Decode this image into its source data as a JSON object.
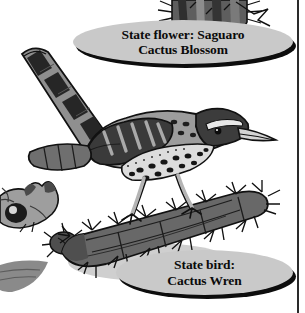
{
  "page": {
    "width": 305,
    "height": 313,
    "background": "#ffffff",
    "border_color": "#2a2a2a"
  },
  "callouts": [
    {
      "id": "state-flower",
      "line1": "State flower: Saguaro",
      "line2": "Cactus Blossom",
      "fill": "#c9c9c9",
      "text_color": "#0b0b0b",
      "shadow": "#0d0d0d"
    },
    {
      "id": "state-bird",
      "line1": "State bird:",
      "line2": "Cactus Wren",
      "fill": "#c9c9c9",
      "text_color": "#0b0b0b",
      "shadow": "#0d0d0d"
    }
  ],
  "artwork": {
    "style": "grayscale clip-art line illustration",
    "subjects": [
      "cactus-wren-bird",
      "thorny-cactus-arm-perch",
      "saguaro-cactus-top",
      "ringtail-animal-head-left",
      "gray-tail-shape-bottom-left"
    ],
    "palette": {
      "outline": "#111111",
      "dark_gray": "#3d3d3d",
      "mid_gray": "#6e6e6e",
      "light_gray": "#a8a8a8",
      "pale_gray": "#cfcfcf",
      "white": "#ffffff"
    }
  }
}
